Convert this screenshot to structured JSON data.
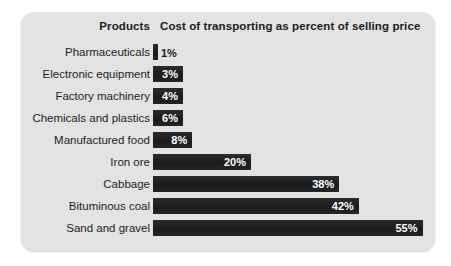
{
  "figure": {
    "card_background": "#e3e3e3",
    "page_background": "#ffffff",
    "bar_color": "#222222",
    "text_color": "#1c1c1c",
    "value_text_color": "#ffffff"
  },
  "header": {
    "products": "Products",
    "measure": "Cost of transporting as percent of selling price"
  },
  "chart_data": {
    "type": "bar",
    "orientation": "horizontal",
    "title": "Cost of transporting as percent of selling price",
    "xlabel": "Cost of transporting as percent of selling price",
    "ylabel": "Products",
    "grid": false,
    "legend": false,
    "xlim": [
      0,
      55
    ],
    "categories": [
      "Pharmaceuticals",
      "Electronic equipment",
      "Factory machinery",
      "Chemicals and plastics",
      "Manufactured food",
      "Iron ore",
      "Cabbage",
      "Bituminous coal",
      "Sand and gravel"
    ],
    "values": [
      1,
      3,
      4,
      6,
      8,
      20,
      38,
      42,
      55
    ],
    "value_labels": [
      "1%",
      "3%",
      "4%",
      "6%",
      "8%",
      "20%",
      "38%",
      "42%",
      "55%"
    ],
    "label_placement": [
      "outside",
      "inside",
      "inside",
      "inside",
      "inside",
      "inside",
      "inside",
      "inside",
      "inside"
    ]
  }
}
